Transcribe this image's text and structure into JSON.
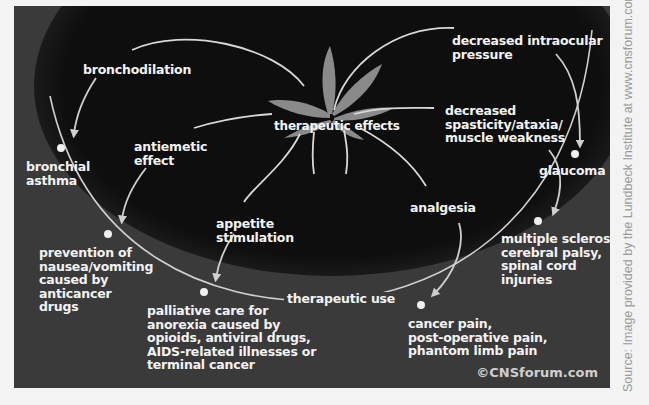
{
  "diagram": {
    "center": {
      "label": "therapeutic effects",
      "icon": "cannabis-leaf-icon"
    },
    "ring_label": "therapeutic use",
    "effects": [
      {
        "id": "bronchodilation",
        "label": "bronchodilation",
        "use": "bronchial\nasthma"
      },
      {
        "id": "antiemetic",
        "label": "antiemetic\neffect",
        "use": "prevention of\nnausea/vomiting\ncaused by\nanticancer\ndrugs"
      },
      {
        "id": "appetite",
        "label": "appetite\nstimulation",
        "use": "palliative care for\nanorexia caused by\nopioids, antiviral drugs,\nAIDS-related illnesses or\nterminal cancer"
      },
      {
        "id": "analgesia",
        "label": "analgesia",
        "use": "cancer pain,\npost-operative pain,\nphantom limb pain"
      },
      {
        "id": "spasticity",
        "label": "decreased\nspasticity/ataxia/\nmuscle weakness",
        "use": "multiple sclerosis,\ncerebral palsy,\nspinal cord\ninjuries"
      },
      {
        "id": "intraocular",
        "label": "decreased intraocular\npressure",
        "use": "glaucoma"
      }
    ],
    "credit": "©CNSforum.com",
    "source": "Source: Image provided by the Lundbeck Institute at www.cnsforum.com"
  },
  "colors": {
    "background": "#f3f3f3",
    "panel": "#3a3a3a",
    "inner_ellipse": "#0e0e0e",
    "leaf": "#8a8a8a",
    "lines": "#d8d8d8",
    "text": "#f2f2f2",
    "source_text": "#9a9a9a"
  }
}
